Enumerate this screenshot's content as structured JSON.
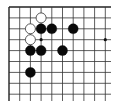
{
  "board": {
    "region": "top-left corner",
    "visible_cols": 10,
    "visible_rows": 9,
    "origin_x": 9,
    "origin_y": 7,
    "spacing_x": 10.7,
    "spacing_y": 10.9,
    "line_color": "#333333",
    "edge_color": "#222222",
    "background": "#ffffff",
    "star_points": [
      {
        "col": 3,
        "row": 3
      },
      {
        "col": 9,
        "row": 3
      }
    ],
    "stones": [
      {
        "color": "white",
        "col": 3,
        "row": 1
      },
      {
        "color": "white",
        "col": 2,
        "row": 2
      },
      {
        "color": "black",
        "col": 3,
        "row": 2
      },
      {
        "color": "black",
        "col": 4,
        "row": 2
      },
      {
        "color": "black",
        "col": 6,
        "row": 2
      },
      {
        "color": "white",
        "col": 2,
        "row": 3
      },
      {
        "color": "black",
        "col": 2,
        "row": 4
      },
      {
        "color": "black",
        "col": 3,
        "row": 4
      },
      {
        "color": "black",
        "col": 5,
        "row": 4
      },
      {
        "color": "black",
        "col": 2,
        "row": 6
      }
    ]
  }
}
